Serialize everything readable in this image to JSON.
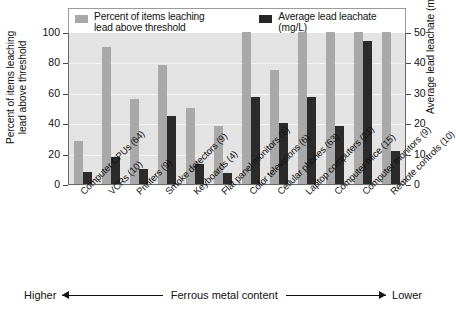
{
  "chart_data": {
    "type": "bar",
    "title": "",
    "categories": [
      "Computer CPUs (64)",
      "VCRs (10)",
      "Printers (9)",
      "Smoke detectors (9)",
      "Keyboards (4)",
      "Flat panel monitors (8)",
      "Color televisions (6)",
      "Cellular phones (63)",
      "Laptop computers (21)",
      "Computer mice (15)",
      "Computer monitors (9)",
      "Remote controls (10)"
    ],
    "series": [
      {
        "name": "Percent of items leaching lead above threshold",
        "axis": "left",
        "unit": "%",
        "color": "#a9a9a9",
        "values": [
          28,
          90,
          56,
          78,
          50,
          38,
          100,
          75,
          100,
          100,
          100,
          100
        ]
      },
      {
        "name": "Average lead leachate (mg/L)",
        "axis": "right",
        "unit": "mg/L",
        "color": "#2b2b2b",
        "values": [
          4,
          9,
          5,
          22.5,
          6.5,
          3.5,
          28.5,
          20,
          28.5,
          19,
          47,
          11
        ]
      }
    ],
    "xlabel": "Ferrous metal content",
    "ylabel": "Percent of items leaching lead above threshold",
    "ylabel_right": "Average lead leachate (mg/L)",
    "ylim": [
      0,
      100
    ],
    "ylim_right": [
      0,
      50
    ],
    "yticks": [
      0,
      20,
      40,
      60,
      80,
      100
    ],
    "yticks_right": [
      0,
      10,
      20,
      30,
      40,
      50
    ],
    "grid": true,
    "legend_position": "top"
  },
  "legend": {
    "items": [
      {
        "label": "Percent of items leaching\nlead above threshold",
        "swatch": "light"
      },
      {
        "label": "Average lead leachate (mg/L)",
        "swatch": "dark"
      }
    ]
  },
  "axes": {
    "left_title": "Percent of items leaching\nlead above threshold",
    "right_title": "Average lead leachate (mg/L)",
    "left_ticks": [
      "100",
      "80",
      "60",
      "40",
      "20",
      "0"
    ],
    "right_ticks": [
      "50",
      "40",
      "30",
      "20",
      "10",
      "0"
    ]
  },
  "footer": {
    "left_word": "Higher",
    "center_text": "Ferrous metal content",
    "right_word": "Lower"
  },
  "colors": {
    "series_light": "#a9a9a9",
    "series_dark": "#2b2b2b",
    "plot_background": "#e3e3e3",
    "gridline": "#f4f4f4",
    "axis": "#6b6b6b",
    "text": "#111111"
  }
}
